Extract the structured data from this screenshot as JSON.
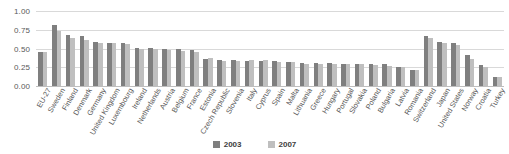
{
  "chart_data": {
    "type": "bar",
    "title": "",
    "subtitle": "",
    "xlabel": "",
    "ylabel": "",
    "ylim": [
      0,
      1.0
    ],
    "yticks": [
      "0.00",
      "0.25",
      "0.50",
      "0.75",
      "1.00"
    ],
    "ytick_values": [
      0.0,
      0.25,
      0.5,
      0.75,
      1.0
    ],
    "grid": true,
    "legend_position": "bottom",
    "categories": [
      "EU-27",
      "Sweden",
      "Finland",
      "Denmark",
      "Germany",
      "United Kingdom",
      "Luxembourg",
      "Ireland",
      "Netherlands",
      "Austria",
      "Belgium",
      "France",
      "Estonia",
      "Czech Republic",
      "Slovenia",
      "Italy",
      "Cyprus",
      "Spain",
      "Malta",
      "Lithuania",
      "Greece",
      "Hungary",
      "Portugal",
      "Slovakia",
      "Poland",
      "Bulgaria",
      "Latvia",
      "Romania",
      "Switzerland",
      "Japan",
      "United States",
      "Norway",
      "Croatia",
      "Turkey"
    ],
    "series": [
      {
        "name": "2003",
        "color": "#7f7f7f",
        "values": [
          0.46,
          0.82,
          0.68,
          0.67,
          0.59,
          0.58,
          0.57,
          0.51,
          0.51,
          0.5,
          0.49,
          0.48,
          0.36,
          0.35,
          0.35,
          0.34,
          0.33,
          0.33,
          0.32,
          0.31,
          0.31,
          0.31,
          0.3,
          0.3,
          0.29,
          0.29,
          0.26,
          0.22,
          0.67,
          0.59,
          0.58,
          0.42,
          0.28,
          0.12
        ]
      },
      {
        "name": "2007",
        "color": "#bfbfbf",
        "values": [
          0.45,
          0.74,
          0.64,
          0.61,
          0.58,
          0.57,
          0.56,
          0.5,
          0.5,
          0.48,
          0.47,
          0.46,
          0.38,
          0.34,
          0.33,
          0.35,
          0.35,
          0.32,
          0.32,
          0.3,
          0.3,
          0.29,
          0.29,
          0.29,
          0.28,
          0.27,
          0.25,
          0.21,
          0.64,
          0.57,
          0.55,
          0.36,
          0.26,
          0.12
        ]
      }
    ]
  },
  "legend": {
    "items": [
      {
        "label": "2003"
      },
      {
        "label": "2007"
      }
    ]
  }
}
